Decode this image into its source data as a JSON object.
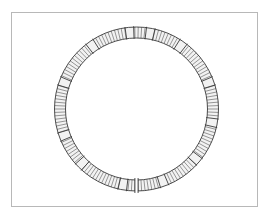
{
  "illustration": {
    "subject": "segmented ring",
    "style": "line drawing",
    "colors": {
      "background": "#ffffff",
      "frame": "#b8b8b8",
      "ink": "#3a3a3a",
      "bead_fill": "#f2f2f2"
    },
    "ring": {
      "center_x": 136.5,
      "center_y": 109,
      "outer_radius": 82,
      "inner_radius": 71,
      "gap_angle_deg": 90,
      "segment_count": 150,
      "smooth_bands": [
        -80,
        -55,
        -20,
        10,
        40,
        70,
        100,
        135,
        160,
        200,
        235,
        265
      ]
    }
  }
}
